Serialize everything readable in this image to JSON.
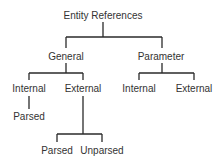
{
  "diagram": {
    "type": "tree",
    "colors": {
      "line": "#2a2a2a",
      "text": "#333333",
      "background": "#ffffff"
    },
    "root": {
      "label": "Entity References"
    },
    "general": {
      "label": "General"
    },
    "parameter": {
      "label": "Parameter"
    },
    "general_internal": {
      "label": "Internal"
    },
    "general_external": {
      "label": "External"
    },
    "parameter_internal": {
      "label": "Internal"
    },
    "parameter_external": {
      "label": "External"
    },
    "general_internal_parsed": {
      "label": "Parsed"
    },
    "general_external_parsed": {
      "label": "Parsed"
    },
    "general_external_unparsed": {
      "label": "Unparsed"
    }
  }
}
